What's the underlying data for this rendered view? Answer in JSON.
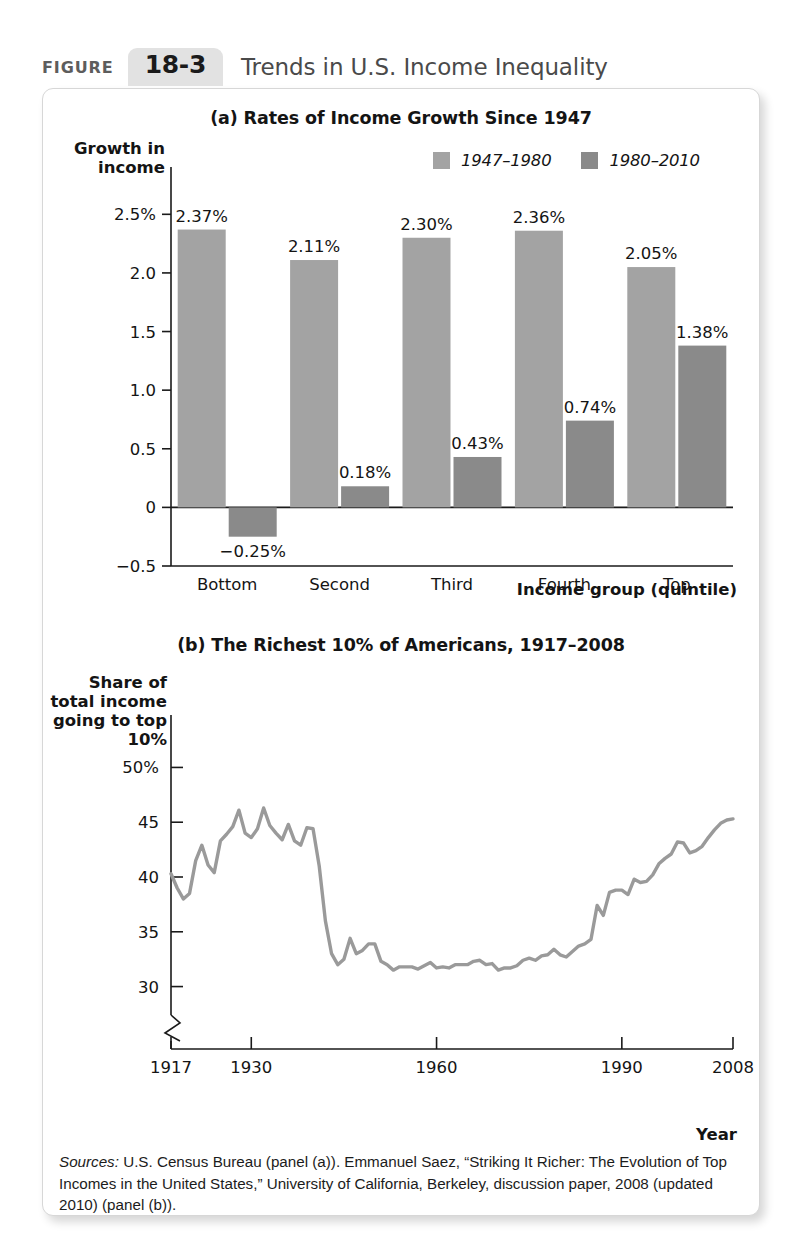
{
  "figure": {
    "label": "FIGURE",
    "number": "18-3",
    "title": "Trends in U.S. Income Inequality"
  },
  "colors": {
    "series_light": "#a3a3a3",
    "series_dark": "#8a8a8a",
    "line": "#9a9a9a",
    "axis": "#1a1a1a",
    "tab_bg": "#e2e2e2",
    "card_border": "#d7d7d7"
  },
  "panel_a": {
    "title": "(a) Rates of Income Growth Since 1947",
    "y_axis_label": "Growth in income",
    "x_axis_label": "Income group (quintile)",
    "legend": [
      {
        "label": "1947–1980",
        "swatch": "#a3a3a3"
      },
      {
        "label": "1980–2010",
        "swatch": "#8a8a8a"
      }
    ]
  },
  "panel_b": {
    "title": "(b) The Richest 10% of Americans, 1917–2008",
    "y_axis_label": "Share of total income going to top 10%",
    "x_axis_label": "Year",
    "axis_break": true
  },
  "sources": {
    "label": "Sources:",
    "text": " U.S. Census Bureau (panel (a)). Emmanuel Saez, “Striking It Richer: The Evolution of Top Incomes in the United States,” University of California, Berkeley, discussion paper, 2008 (updated 2010) (panel (b))."
  },
  "chart_data": [
    {
      "type": "bar",
      "title": "(a) Rates of Income Growth Since 1947",
      "xlabel": "Income group (quintile)",
      "ylabel": "Growth in income",
      "categories": [
        "Bottom",
        "Second",
        "Third",
        "Fourth",
        "Top"
      ],
      "series": [
        {
          "name": "1947–1980",
          "color": "#a3a3a3",
          "values": [
            2.37,
            2.11,
            2.3,
            2.36,
            2.05
          ],
          "labels": [
            "2.37%",
            "2.11%",
            "2.30%",
            "2.36%",
            "2.05%"
          ]
        },
        {
          "name": "1980–2010",
          "color": "#8a8a8a",
          "values": [
            -0.25,
            0.18,
            0.43,
            0.74,
            1.38
          ],
          "labels": [
            "−0.25%",
            "0.18%",
            "0.43%",
            "0.74%",
            "1.38%"
          ]
        }
      ],
      "ylim": [
        -0.5,
        2.75
      ],
      "yticks": [
        -0.5,
        0,
        0.5,
        1.0,
        1.5,
        2.0,
        2.5
      ],
      "ytick_labels": [
        "−0.5",
        "0",
        "0.5",
        "1.0",
        "1.5",
        "2.0",
        "2.5%"
      ],
      "grid": false,
      "legend_position": "top-right"
    },
    {
      "type": "line",
      "title": "(b) The Richest 10% of Americans, 1917–2008",
      "xlabel": "Year",
      "ylabel": "Share of total income going to top 10%",
      "ylim": [
        28.5,
        51.5
      ],
      "yticks": [
        30,
        35,
        40,
        45,
        50
      ],
      "ytick_labels": [
        "30",
        "35",
        "40",
        "45",
        "50%"
      ],
      "xlim": [
        1917,
        2008
      ],
      "xticks": [
        1917,
        1930,
        1960,
        1990,
        2008
      ],
      "xtick_labels": [
        "1917",
        "1930",
        "1960",
        "1990",
        "2008"
      ],
      "grid": false,
      "series_name": "Share of total income going to top 10%",
      "color": "#9a9a9a",
      "x": [
        1917,
        1918,
        1919,
        1920,
        1921,
        1922,
        1923,
        1924,
        1925,
        1926,
        1927,
        1928,
        1929,
        1930,
        1931,
        1932,
        1933,
        1934,
        1935,
        1936,
        1937,
        1938,
        1939,
        1940,
        1941,
        1942,
        1943,
        1944,
        1945,
        1946,
        1947,
        1948,
        1949,
        1950,
        1951,
        1952,
        1953,
        1954,
        1955,
        1956,
        1957,
        1958,
        1959,
        1960,
        1961,
        1962,
        1963,
        1964,
        1965,
        1966,
        1967,
        1968,
        1969,
        1970,
        1971,
        1972,
        1973,
        1974,
        1975,
        1976,
        1977,
        1978,
        1979,
        1980,
        1981,
        1982,
        1983,
        1984,
        1985,
        1986,
        1987,
        1988,
        1989,
        1990,
        1991,
        1992,
        1993,
        1994,
        1995,
        1996,
        1997,
        1998,
        1999,
        2000,
        2001,
        2002,
        2003,
        2004,
        2005,
        2006,
        2007,
        2008
      ],
      "y": [
        40.3,
        39.0,
        38.0,
        38.5,
        41.5,
        42.9,
        41.1,
        40.4,
        43.3,
        43.9,
        44.6,
        46.1,
        44.0,
        43.6,
        44.4,
        46.3,
        44.7,
        44.0,
        43.4,
        44.8,
        43.3,
        42.9,
        44.5,
        44.4,
        41.0,
        36.0,
        33.0,
        32.0,
        32.5,
        34.4,
        33.0,
        33.3,
        33.9,
        33.9,
        32.3,
        32.0,
        31.5,
        31.8,
        31.8,
        31.8,
        31.6,
        31.9,
        32.2,
        31.7,
        31.8,
        31.7,
        32.0,
        32.0,
        32.0,
        32.3,
        32.4,
        32.0,
        32.1,
        31.5,
        31.7,
        31.7,
        31.9,
        32.4,
        32.6,
        32.4,
        32.8,
        32.9,
        33.4,
        32.9,
        32.7,
        33.2,
        33.7,
        33.9,
        34.3,
        37.4,
        36.5,
        38.6,
        38.8,
        38.8,
        38.4,
        39.8,
        39.5,
        39.6,
        40.2,
        41.2,
        41.7,
        42.1,
        43.2,
        43.1,
        42.2,
        42.4,
        42.8,
        43.6,
        44.3,
        44.9,
        45.2,
        45.3
      ]
    }
  ]
}
